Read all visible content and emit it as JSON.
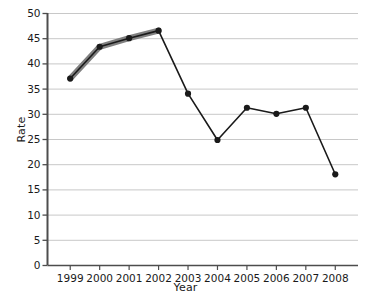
{
  "chart_data": {
    "type": "line",
    "title": "",
    "xlabel": "Year",
    "ylabel": "Rate",
    "categories": [
      "1999",
      "2000",
      "2001",
      "2002",
      "2003",
      "2004",
      "2005",
      "2006",
      "2007",
      "2008"
    ],
    "x": [
      1999,
      2000,
      2001,
      2002,
      2003,
      2004,
      2005,
      2006,
      2007,
      2008
    ],
    "values": [
      37,
      43.3,
      45,
      46.5,
      34,
      24.8,
      31.2,
      30,
      31.2,
      18
    ],
    "series": [
      {
        "name": "Rate",
        "values": [
          37,
          43.3,
          45,
          46.5,
          34,
          24.8,
          31.2,
          30,
          31.2,
          18
        ]
      }
    ],
    "ylim": [
      0,
      50
    ],
    "ytick_labels": [
      "0",
      "5",
      "10",
      "15",
      "20",
      "25",
      "30",
      "35",
      "40",
      "45",
      "50"
    ],
    "yticks": [
      0,
      5,
      10,
      15,
      20,
      25,
      30,
      35,
      40,
      45,
      50
    ],
    "xtick_labels": [
      "1999",
      "2000",
      "2001",
      "2002",
      "2003",
      "2004",
      "2005",
      "2006",
      "2007",
      "2008"
    ],
    "grid": "horizontal",
    "legend": "none",
    "annotations": [
      {
        "kind": "highlighted-segment",
        "from": "1999",
        "to": "2002",
        "description": "rising portion of the line drawn as a thick gray overlay"
      }
    ],
    "colors": {
      "line": "#1a1a1a",
      "marker": "#1a1a1a",
      "highlight": "#808080",
      "grid": "#c8c8c8",
      "axis": "#4d4d4d",
      "background": "#ffffff"
    }
  }
}
